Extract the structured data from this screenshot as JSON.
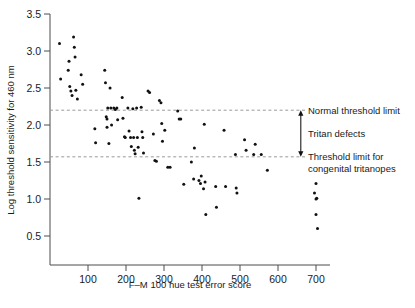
{
  "chart_data": {
    "type": "scatter",
    "title": "",
    "xlabel": "F–M 100 hue test error score",
    "ylabel": "Log threshold sensitivity for 460 nm",
    "xlim": [
      0,
      730
    ],
    "ylim": [
      0.35,
      3.5
    ],
    "grid": false,
    "legend_position": "none",
    "xticks": [
      100,
      200,
      300,
      400,
      500,
      600,
      700
    ],
    "xtick_labels": [
      "100",
      "200",
      "300",
      "400",
      "500",
      "600",
      "700"
    ],
    "yticks": [
      0.5,
      1.0,
      1.5,
      2.0,
      2.5,
      3.0,
      3.5
    ],
    "ytick_labels": [
      "0.5",
      "1.0",
      "1.5",
      "2.0",
      "2.5",
      "3.0",
      "3.5"
    ],
    "reference_lines": [
      {
        "name": "normal-threshold-limit",
        "orientation": "horizontal",
        "y": 2.2,
        "label": "Normal threshold limit",
        "style": "dashed"
      },
      {
        "name": "congenital-tritanope-threshold-limit",
        "orientation": "horizontal",
        "y": 1.57,
        "label": "Threshold limit for congenital tritanopes",
        "label_line1": "Threshold limit for",
        "label_line2": "congenital tritanopes",
        "style": "dashed"
      }
    ],
    "annotations": [
      {
        "name": "tritan-defects-range",
        "label": "Tritan defects",
        "type": "double-headed-arrow",
        "y_from": 2.2,
        "y_to": 1.57,
        "x": 660
      }
    ],
    "series": [
      {
        "name": "observers",
        "marker": "dot",
        "color": "#111111",
        "points": [
          [
            25,
            3.1
          ],
          [
            28,
            2.62
          ],
          [
            48,
            2.74
          ],
          [
            50,
            2.86
          ],
          [
            52,
            2.52
          ],
          [
            55,
            2.46
          ],
          [
            58,
            2.4
          ],
          [
            62,
            3.19
          ],
          [
            64,
            3.05
          ],
          [
            66,
            2.92
          ],
          [
            68,
            2.47
          ],
          [
            72,
            2.35
          ],
          [
            82,
            2.68
          ],
          [
            86,
            2.55
          ],
          [
            118,
            1.95
          ],
          [
            120,
            1.76
          ],
          [
            144,
            2.74
          ],
          [
            146,
            2.57
          ],
          [
            148,
            2.11
          ],
          [
            150,
            2.08
          ],
          [
            150,
            1.97
          ],
          [
            152,
            2.23
          ],
          [
            155,
            1.75
          ],
          [
            158,
            2.5
          ],
          [
            160,
            2.23
          ],
          [
            162,
            2.0
          ],
          [
            168,
            2.23
          ],
          [
            172,
            2.21
          ],
          [
            176,
            2.23
          ],
          [
            178,
            2.07
          ],
          [
            190,
            2.37
          ],
          [
            192,
            2.09
          ],
          [
            196,
            1.84
          ],
          [
            198,
            1.83
          ],
          [
            205,
            2.23
          ],
          [
            208,
            1.92
          ],
          [
            212,
            1.83
          ],
          [
            214,
            1.71
          ],
          [
            218,
            2.22
          ],
          [
            220,
            1.83
          ],
          [
            222,
            1.66
          ],
          [
            224,
            1.61
          ],
          [
            228,
            2.23
          ],
          [
            230,
            1.83
          ],
          [
            232,
            1.7
          ],
          [
            234,
            1.01
          ],
          [
            240,
            2.24
          ],
          [
            242,
            1.91
          ],
          [
            244,
            1.83
          ],
          [
            246,
            1.62
          ],
          [
            258,
            2.46
          ],
          [
            262,
            2.44
          ],
          [
            272,
            1.88
          ],
          [
            276,
            1.52
          ],
          [
            280,
            1.51
          ],
          [
            288,
            2.33
          ],
          [
            292,
            2.3
          ],
          [
            294,
            2.02
          ],
          [
            296,
            1.78
          ],
          [
            302,
            1.93
          ],
          [
            310,
            1.43
          ],
          [
            316,
            1.43
          ],
          [
            336,
            2.19
          ],
          [
            340,
            2.08
          ],
          [
            344,
            2.08
          ],
          [
            352,
            1.2
          ],
          [
            372,
            1.5
          ],
          [
            378,
            1.27
          ],
          [
            380,
            1.69
          ],
          [
            392,
            1.25
          ],
          [
            396,
            1.21
          ],
          [
            398,
            1.31
          ],
          [
            404,
            1.14
          ],
          [
            406,
            2.01
          ],
          [
            408,
            1.23
          ],
          [
            410,
            0.79
          ],
          [
            436,
            1.17
          ],
          [
            438,
            0.89
          ],
          [
            458,
            1.93
          ],
          [
            462,
            1.17
          ],
          [
            488,
            1.6
          ],
          [
            490,
            1.15
          ],
          [
            492,
            1.08
          ],
          [
            512,
            1.8
          ],
          [
            516,
            1.66
          ],
          [
            536,
            1.6
          ],
          [
            540,
            1.74
          ],
          [
            556,
            1.6
          ],
          [
            572,
            1.39
          ],
          [
            696,
            1.08
          ],
          [
            700,
            1.21
          ],
          [
            700,
            1.0
          ],
          [
            702,
            1.01
          ],
          [
            700,
            0.79
          ],
          [
            704,
            0.6
          ]
        ]
      }
    ]
  },
  "axes": {
    "x_axis_name": "x-axis",
    "y_axis_name": "y-axis"
  }
}
